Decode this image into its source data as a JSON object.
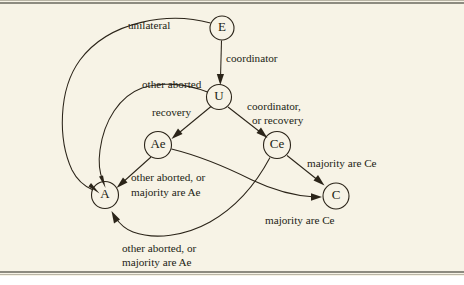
{
  "figure": {
    "type": "state-transition-diagram",
    "background_color": "#f7f3e6",
    "ink_color": "#2b2419",
    "rule_color": "#8d8b80"
  },
  "nodes": [
    {
      "id": "E",
      "label": "E",
      "cx": 222,
      "cy": 28,
      "r": 12
    },
    {
      "id": "U",
      "label": "U",
      "cx": 219,
      "cy": 97,
      "r": 12.5
    },
    {
      "id": "Ae",
      "label": "Ae",
      "cx": 158,
      "cy": 145,
      "r": 13.5
    },
    {
      "id": "Ce",
      "label": "Ce",
      "cx": 277,
      "cy": 145,
      "r": 13.5
    },
    {
      "id": "A",
      "label": "A",
      "cx": 105,
      "cy": 195,
      "r": 13.5
    },
    {
      "id": "C",
      "label": "C",
      "cx": 336,
      "cy": 196,
      "r": 13
    }
  ],
  "edges": [
    {
      "id": "e-to-a",
      "from": "E",
      "to": "A",
      "label": "unilateral"
    },
    {
      "id": "e-to-u",
      "from": "E",
      "to": "U",
      "label": "coordinator"
    },
    {
      "id": "u-to-a",
      "from": "U",
      "to": "A",
      "label": "other aborted"
    },
    {
      "id": "u-to-ae",
      "from": "U",
      "to": "Ae",
      "label": "recovery"
    },
    {
      "id": "u-to-ce",
      "from": "U",
      "to": "Ce",
      "label": "coordinator,\nor recovery"
    },
    {
      "id": "ae-to-a",
      "from": "Ae",
      "to": "A",
      "label": "other aborted, or\nmajority are Ae"
    },
    {
      "id": "ae-to-c",
      "from": "Ae",
      "to": "C",
      "label": "majority are Ce"
    },
    {
      "id": "ce-to-c",
      "from": "Ce",
      "to": "C",
      "label": "majority are Ce"
    },
    {
      "id": "ce-to-a",
      "from": "Ce",
      "to": "A",
      "label": "other aborted, or\nmajority are Ae"
    }
  ],
  "labels": [
    {
      "id": "label-unilateral",
      "text": "unilateral",
      "x": 128,
      "y": 29
    },
    {
      "id": "label-coordinator",
      "text": "coordinator",
      "x": 226,
      "y": 62
    },
    {
      "id": "label-other-aborted",
      "text": "other aborted",
      "x": 142,
      "y": 88
    },
    {
      "id": "label-recovery",
      "text": "recovery",
      "x": 152,
      "y": 116
    },
    {
      "id": "label-coordinator-2",
      "text": "coordinator,",
      "x": 247,
      "y": 110
    },
    {
      "id": "label-or-recovery",
      "text": "or recovery",
      "x": 252,
      "y": 124
    },
    {
      "id": "label-other-aborted-or",
      "text": "other aborted, or",
      "x": 131,
      "y": 181
    },
    {
      "id": "label-majority-are-ae",
      "text": "majority are Ae",
      "x": 131,
      "y": 196
    },
    {
      "id": "label-majority-are-ce",
      "text": "majority are Ce",
      "x": 307,
      "y": 167
    },
    {
      "id": "label-majority-are-ce-2",
      "text": "majority are Ce",
      "x": 265,
      "y": 224
    },
    {
      "id": "label-other-aborted-or-2",
      "text": "other aborted, or",
      "x": 122,
      "y": 252
    },
    {
      "id": "label-majority-are-ae-2",
      "text": "majority are Ae",
      "x": 122,
      "y": 266
    }
  ]
}
